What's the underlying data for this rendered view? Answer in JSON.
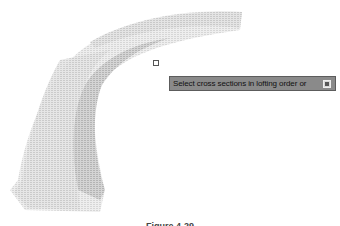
{
  "viewport": {
    "object": "lofted-solid",
    "colors": {
      "background": "#ffffff",
      "surface_light": "#e6e6e6",
      "surface_mid": "#cfcfcf",
      "surface_dark": "#b8b8b8",
      "tooltip_bg": "#8a8a8a"
    }
  },
  "tooltip": {
    "prompt": "Select cross sections in lofting order or",
    "options_icon": "down-arrow-options-icon"
  },
  "caption": {
    "text": "Figure 4-29"
  }
}
